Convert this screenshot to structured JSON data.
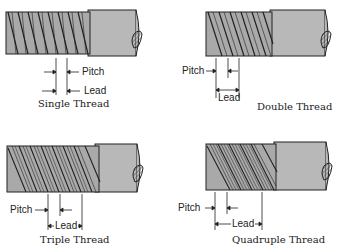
{
  "figure": {
    "panels": [
      {
        "id": "single",
        "caption": "Single Thread",
        "pitch_label": "Pitch",
        "lead_label": "Lead",
        "starts": 1
      },
      {
        "id": "double",
        "caption": "Double Thread",
        "pitch_label": "Pitch",
        "lead_label": "Lead",
        "starts": 2
      },
      {
        "id": "triple",
        "caption": "Triple Thread",
        "pitch_label": "Pitch",
        "lead_label": "Lead",
        "starts": 3
      },
      {
        "id": "quadruple",
        "caption": "Quadruple Thread",
        "pitch_label": "Pitch",
        "lead_label": "Lead",
        "starts": 4
      }
    ],
    "colors": {
      "shaft": "#b8b8b8",
      "thread": "#a9a9a9",
      "outline": "#222222"
    }
  }
}
